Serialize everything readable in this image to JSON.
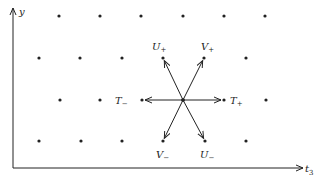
{
  "axes": {
    "y_label": "y",
    "x_label": "t",
    "x_label_subscript": "3"
  },
  "lattice_points": [
    [
      59,
      16
    ],
    [
      100,
      16
    ],
    [
      141,
      16
    ],
    [
      183,
      16
    ],
    [
      224,
      16
    ],
    [
      265,
      16
    ],
    [
      39,
      58
    ],
    [
      80,
      58
    ],
    [
      122,
      58
    ],
    [
      163,
      58
    ],
    [
      204,
      58
    ],
    [
      246,
      58
    ],
    [
      60,
      100
    ],
    [
      100,
      100
    ],
    [
      142,
      100
    ],
    [
      183,
      100
    ],
    [
      224,
      100
    ],
    [
      266,
      100
    ],
    [
      39,
      141
    ],
    [
      81,
      141
    ],
    [
      122,
      141
    ],
    [
      163,
      141
    ],
    [
      205,
      141
    ],
    [
      246,
      141
    ]
  ],
  "center": [
    183,
    100
  ],
  "vectors": [
    {
      "name": "U+",
      "label": "U",
      "sign": "+",
      "to": [
        163,
        58
      ],
      "label_pos": [
        152,
        50
      ]
    },
    {
      "name": "V+",
      "label": "V",
      "sign": "+",
      "to": [
        204,
        58
      ],
      "label_pos": [
        201,
        50
      ]
    },
    {
      "name": "T+",
      "label": "T",
      "sign": "+",
      "to": [
        224,
        100
      ],
      "label_pos": [
        230,
        104
      ]
    },
    {
      "name": "T-",
      "label": "T",
      "sign": "−",
      "to": [
        142,
        100
      ],
      "label_pos": [
        115,
        104
      ]
    },
    {
      "name": "V-",
      "label": "V",
      "sign": "−",
      "to": [
        163,
        141
      ],
      "label_pos": [
        156,
        158
      ]
    },
    {
      "name": "U-",
      "label": "U",
      "sign": "−",
      "to": [
        205,
        141
      ],
      "label_pos": [
        200,
        158
      ]
    }
  ],
  "colors": {
    "ink": "#222222",
    "background": "#ffffff"
  }
}
